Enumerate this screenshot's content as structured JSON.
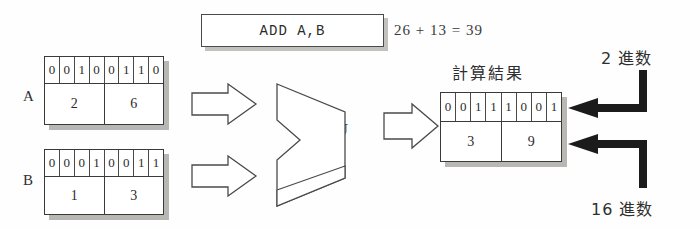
{
  "diagram": {
    "instruction": {
      "text": "ADD A,B"
    },
    "arithmetic": {
      "text": "26 + 13 = 39"
    },
    "alu": {
      "label": "ALU"
    },
    "result_caption": "計算結果",
    "annotations": {
      "binary": "2 進数",
      "hexadecimal": "16 進数"
    },
    "registers": [
      {
        "name": "A",
        "label": "A",
        "bits": [
          "0",
          "0",
          "1",
          "0",
          "0",
          "1",
          "1",
          "0"
        ],
        "nibbles": [
          "2",
          "6"
        ]
      },
      {
        "name": "B",
        "label": "B",
        "bits": [
          "0",
          "0",
          "0",
          "1",
          "0",
          "0",
          "1",
          "1"
        ],
        "nibbles": [
          "1",
          "3"
        ]
      },
      {
        "name": "result",
        "label": "",
        "bits": [
          "0",
          "0",
          "1",
          "1",
          "1",
          "0",
          "0",
          "1"
        ],
        "nibbles": [
          "3",
          "9"
        ]
      }
    ],
    "colors": {
      "ink": "#2b2b2b",
      "line": "#4a4a4a",
      "shadow": "#b9b7b4",
      "background": "#ffffff",
      "arrow_fill": "#1b1b1b"
    }
  }
}
